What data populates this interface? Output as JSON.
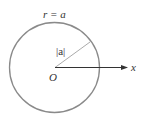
{
  "diagram": {
    "curve_label": "r = a",
    "radius_label": "|a|",
    "origin_label": "O",
    "axis_label": "x",
    "colors": {
      "circle": "#888888",
      "axis": "#333333",
      "radius": "#999999",
      "text": "#333333"
    }
  }
}
